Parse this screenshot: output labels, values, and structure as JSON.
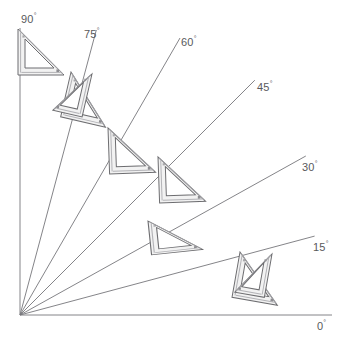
{
  "diagram": {
    "origin": {
      "x": 20,
      "y": 315
    },
    "colors": {
      "axis": "#6f6f72",
      "ray": "#76767a",
      "label_text": "#59595b",
      "square_fill": "#f1f1f1",
      "square_outline": "#6b6b6e",
      "square_edge_shade": "#a9a9ad",
      "background": "#ffffff"
    },
    "degree_symbol": "°",
    "labels": [
      {
        "id": "deg-90",
        "text": "90",
        "unit": "°",
        "x": 21,
        "y": 10
      },
      {
        "id": "deg-75",
        "text": "75",
        "unit": "°",
        "x": 84,
        "y": 25
      },
      {
        "id": "deg-60",
        "text": "60",
        "unit": "°",
        "x": 181,
        "y": 33
      },
      {
        "id": "deg-45",
        "text": "45",
        "unit": "°",
        "x": 257,
        "y": 78
      },
      {
        "id": "deg-30",
        "text": "30",
        "unit": "°",
        "x": 302,
        "y": 158
      },
      {
        "id": "deg-15",
        "text": "15",
        "unit": "°",
        "x": 313,
        "y": 238
      },
      {
        "id": "deg-0",
        "text": "0",
        "unit": "°",
        "x": 317,
        "y": 317
      }
    ],
    "rays": [
      {
        "id": "ray-90",
        "angle": 90,
        "length": 288,
        "label": "90"
      },
      {
        "id": "ray-75",
        "angle": 75,
        "length": 295,
        "label": "75"
      },
      {
        "id": "ray-60",
        "angle": 60,
        "length": 320,
        "label": "60"
      },
      {
        "id": "ray-45",
        "angle": 45,
        "length": 332,
        "label": "45"
      },
      {
        "id": "ray-30",
        "angle": 30,
        "length": 330,
        "label": "30"
      },
      {
        "id": "ray-15",
        "angle": 15,
        "length": 305,
        "label": "15"
      },
      {
        "id": "ray-0",
        "angle": 0,
        "length": 315,
        "label": "0"
      }
    ],
    "axes": [
      {
        "id": "axis-vertical",
        "label": "90"
      },
      {
        "id": "axis-horizontal",
        "label": "0"
      }
    ],
    "set_squares": [
      {
        "id": "set-square-90",
        "at_angle": 90,
        "count": 1,
        "kind": "45-45-90"
      },
      {
        "id": "set-square-75",
        "at_angle": 75,
        "count": 2,
        "kind": "45-45-90 + 30-60-90"
      },
      {
        "id": "set-square-60",
        "at_angle": 60,
        "count": 1,
        "kind": "45-45-90"
      },
      {
        "id": "set-square-45",
        "at_angle": 45,
        "count": 1,
        "kind": "45-45-90"
      },
      {
        "id": "set-square-30",
        "at_angle": 30,
        "count": 1,
        "kind": "45-45-90"
      },
      {
        "id": "set-square-15",
        "at_angle": 15,
        "count": 2,
        "kind": "45-45-90 + 30-60-90"
      }
    ]
  }
}
